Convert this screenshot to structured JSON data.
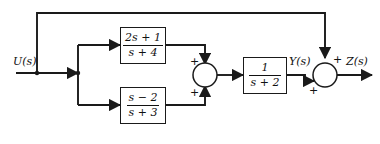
{
  "diagram": {
    "line_color": "#1a1a1a",
    "text_color": "#111111",
    "background": "#ffffff",
    "labels": {
      "input": "U(s)",
      "intermediate": "Y(s)",
      "output": "Z(s)"
    },
    "blocks": [
      {
        "id": "block-top",
        "name": "transfer-function-block-top",
        "numerator": "2s + 1",
        "denominator": "s + 4",
        "expression": "(2s + 1)/(s + 4)"
      },
      {
        "id": "block-bottom",
        "name": "transfer-function-block-bottom",
        "numerator": "s − 2",
        "denominator": "s + 3",
        "expression": "(s - 2)/(s + 3)"
      },
      {
        "id": "block-right",
        "name": "transfer-function-block-right",
        "numerator": "1",
        "denominator": "s + 2",
        "expression": "1/(s + 2)"
      }
    ],
    "summers": [
      {
        "id": "summer-left",
        "name": "summing-junction-left",
        "signs": [
          "+",
          "+"
        ],
        "sign_top": "+",
        "sign_bottom": "+"
      },
      {
        "id": "summer-right",
        "name": "summing-junction-right",
        "signs": [
          "+",
          "+"
        ],
        "sign_top": "+",
        "sign_bottom": "+"
      }
    ]
  }
}
